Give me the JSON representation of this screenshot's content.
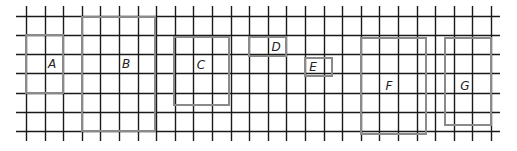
{
  "diagram": {
    "type": "grid-with-rectangles",
    "grid": {
      "x_start": 26,
      "x_step": 18.6,
      "x_count": 26,
      "y_lines": [
        16,
        35,
        54,
        73,
        93,
        112,
        131
      ],
      "line_top": 6,
      "line_bottom": 141,
      "line_left": 16,
      "line_right": 500,
      "line_color": "#1a1a1a"
    },
    "rectangle_color": "#8a8a8a",
    "shapes": [
      {
        "label": "A",
        "x": 26,
        "y": 35,
        "w": 37,
        "h": 58,
        "label_x": 52,
        "label_y": 68
      },
      {
        "label": "B",
        "x": 82,
        "y": 17,
        "w": 73,
        "h": 114,
        "label_x": 126,
        "label_y": 68
      },
      {
        "label": "C",
        "x": 174,
        "y": 37,
        "w": 55,
        "h": 68,
        "label_x": 201,
        "label_y": 69
      },
      {
        "label": "D",
        "x": 249,
        "y": 37,
        "w": 37,
        "h": 19,
        "label_x": 276,
        "label_y": 51
      },
      {
        "label": "E",
        "x": 305,
        "y": 58,
        "w": 27,
        "h": 18,
        "label_x": 313,
        "label_y": 71
      },
      {
        "label": "F",
        "x": 361,
        "y": 38,
        "w": 65,
        "h": 96,
        "label_x": 389,
        "label_y": 90
      },
      {
        "label": "G",
        "x": 445,
        "y": 38,
        "w": 46,
        "h": 87,
        "label_x": 465,
        "label_y": 90
      }
    ]
  }
}
